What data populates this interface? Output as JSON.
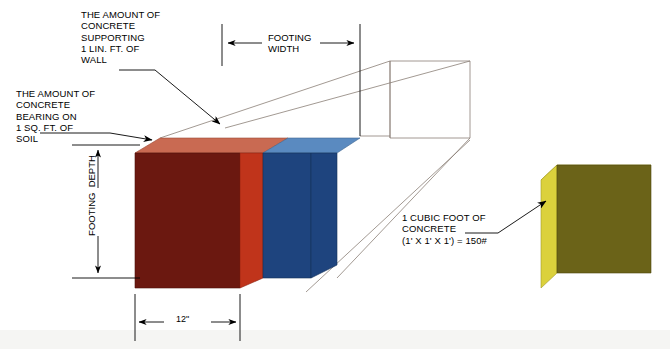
{
  "diagram": {
    "background_color": "#ffffff",
    "line_color": "#000000",
    "wireframe_color": "#8a7f76"
  },
  "callouts": {
    "wall_support": {
      "name": "the-amount-of-concrete-supporting-1-lin-ft-of-wall",
      "text": "THE AMOUNT OF\nCONCRETE\nSUPPORTING\n1 LIN. FT. OF\nWALL"
    },
    "soil_bearing": {
      "name": "the-amount-of-concrete-bearing-on-1-sq-ft-of-soil",
      "text": "THE AMOUNT OF\nCONCRETE\nBEARING ON\n1 SQ. FT. OF\nSOIL"
    },
    "cubic_foot": {
      "name": "one-cubic-foot-of-concrete",
      "text": "1 CUBIC FOOT OF\nCONCRETE\n(1' X 1' X 1') = 150#",
      "line1": "1 CUBIC FOOT OF",
      "line2": "CONCRETE",
      "line3": "(1' X 1' X 1') = 150#",
      "weight": "150#",
      "dimensions": "1' X 1' X 1'"
    }
  },
  "dimensions": {
    "footing_width": {
      "label": "FOOTING\nWIDTH",
      "line1": "FOOTING",
      "line2": "WIDTH"
    },
    "footing_depth": {
      "label": "FOOTING  DEPTH",
      "line1": "FOOTING",
      "line2": "DEPTH"
    },
    "footing_thickness": {
      "label": "12\""
    }
  },
  "solids": {
    "red_block": {
      "name": "concrete-bearing-on-1-sq-ft-of-soil-block",
      "front_color": "#6b1810",
      "side_color": "#c0341b",
      "top_color": "#c96a52"
    },
    "blue_block": {
      "name": "concrete-supporting-1-lin-ft-of-wall-block",
      "front_color": "#1e447e",
      "side_color": "#1e447e",
      "top_color": "#5a8ac0"
    },
    "yellow_cube": {
      "name": "one-cubic-foot-concrete-cube",
      "front_color": "#6b6318",
      "side_color": "#dbd13c",
      "top_color": "#d8ce3f"
    }
  }
}
